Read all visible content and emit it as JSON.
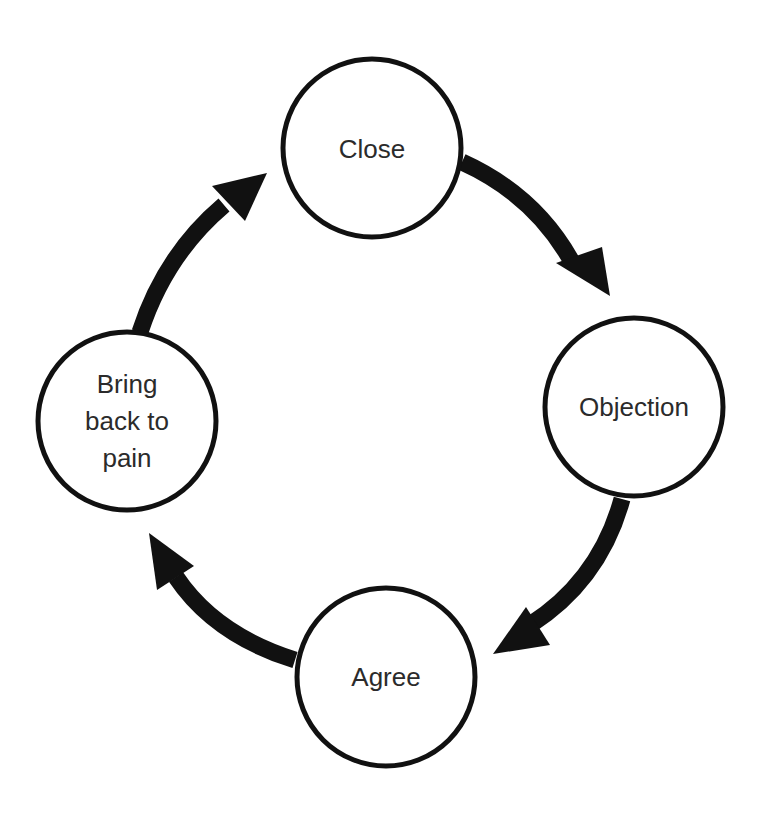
{
  "diagram": {
    "type": "cycle",
    "direction": "clockwise",
    "colors": {
      "stroke": "#111111",
      "fill": "#ffffff",
      "text": "#2b2b2b"
    },
    "nodes": [
      {
        "id": "close",
        "lines": [
          "Close"
        ]
      },
      {
        "id": "objection",
        "lines": [
          "Objection"
        ]
      },
      {
        "id": "agree",
        "lines": [
          "Agree"
        ]
      },
      {
        "id": "bring-back-to-pain",
        "lines": [
          "Bring",
          "back to",
          "pain"
        ]
      }
    ],
    "edges": [
      {
        "from": "close",
        "to": "objection"
      },
      {
        "from": "objection",
        "to": "agree"
      },
      {
        "from": "agree",
        "to": "bring-back-to-pain"
      },
      {
        "from": "bring-back-to-pain",
        "to": "close"
      }
    ]
  }
}
